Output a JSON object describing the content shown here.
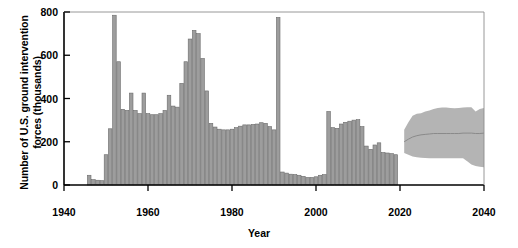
{
  "chart_data": {
    "type": "bar",
    "title": "",
    "subtitle": "",
    "xlabel": "Year",
    "ylabel": "Number of U.S. ground intervention forces (thousands)",
    "ylabel_line1": "Number of U.S. ground intervention",
    "ylabel_line2": "forces (thousands)",
    "xlim": [
      1940,
      2040
    ],
    "ylim": [
      0,
      800
    ],
    "xticks": [
      1940,
      1960,
      1980,
      2000,
      2020,
      2040
    ],
    "yticks": [
      0,
      200,
      400,
      600,
      800
    ],
    "grid": false,
    "legend": "none",
    "bar_color": "#9d9d9d",
    "bar_edge_color": "#6b6b6b",
    "band_color": "#b4b4b4",
    "band_line_color": "#8a8a8a",
    "axis_color": "#000000",
    "categories": [
      1946,
      1947,
      1948,
      1949,
      1950,
      1951,
      1952,
      1953,
      1954,
      1955,
      1956,
      1957,
      1958,
      1959,
      1960,
      1961,
      1962,
      1963,
      1964,
      1965,
      1966,
      1967,
      1968,
      1969,
      1970,
      1971,
      1972,
      1973,
      1974,
      1975,
      1976,
      1977,
      1978,
      1979,
      1980,
      1981,
      1982,
      1983,
      1984,
      1985,
      1986,
      1987,
      1988,
      1989,
      1990,
      1991,
      1992,
      1993,
      1994,
      1995,
      1996,
      1997,
      1998,
      1999,
      2000,
      2001,
      2002,
      2003,
      2004,
      2005,
      2006,
      2007,
      2008,
      2009,
      2010,
      2011,
      2012,
      2013,
      2014,
      2015,
      2016,
      2017,
      2018,
      2019
    ],
    "values": [
      45,
      25,
      22,
      20,
      140,
      260,
      785,
      570,
      350,
      345,
      425,
      345,
      330,
      425,
      330,
      325,
      325,
      330,
      345,
      415,
      365,
      360,
      470,
      570,
      675,
      715,
      700,
      585,
      435,
      285,
      268,
      258,
      255,
      255,
      258,
      265,
      272,
      278,
      278,
      280,
      282,
      288,
      285,
      270,
      255,
      775,
      60,
      55,
      50,
      48,
      45,
      40,
      35,
      35,
      38,
      45,
      48,
      340,
      265,
      262,
      282,
      290,
      295,
      300,
      302,
      270,
      180,
      165,
      185,
      195,
      150,
      148,
      145,
      140
    ],
    "projection": {
      "label": "projected range",
      "x": [
        2021,
        2022,
        2023,
        2024,
        2025,
        2026,
        2027,
        2028,
        2029,
        2030,
        2031,
        2032,
        2033,
        2034,
        2035,
        2036,
        2037,
        2038,
        2039,
        2040
      ],
      "upper": [
        255,
        290,
        320,
        330,
        332,
        340,
        345,
        352,
        356,
        358,
        358,
        356,
        355,
        356,
        358,
        360,
        360,
        340,
        352,
        356
      ],
      "lower": [
        148,
        140,
        132,
        128,
        126,
        125,
        124,
        124,
        124,
        124,
        124,
        124,
        124,
        124,
        124,
        110,
        95,
        88,
        84,
        82
      ],
      "median": [
        200,
        212,
        222,
        228,
        232,
        234,
        236,
        238,
        238,
        238,
        238,
        238,
        238,
        238,
        240,
        240,
        240,
        238,
        238,
        240
      ]
    }
  }
}
